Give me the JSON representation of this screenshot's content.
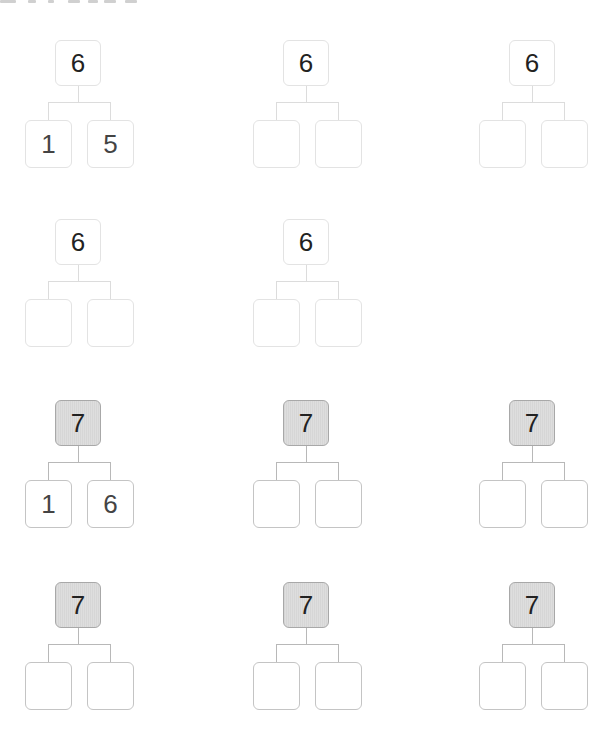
{
  "worksheet": {
    "rows": [
      {
        "style": "plain",
        "trees": [
          {
            "top": "6",
            "left": "1",
            "right": "5"
          },
          {
            "top": "6",
            "left": "",
            "right": ""
          },
          {
            "top": "6",
            "left": "",
            "right": ""
          }
        ]
      },
      {
        "style": "plain",
        "trees": [
          {
            "top": "6",
            "left": "",
            "right": ""
          },
          {
            "top": "6",
            "left": "",
            "right": ""
          }
        ]
      },
      {
        "style": "shaded",
        "trees": [
          {
            "top": "7",
            "left": "1",
            "right": "6"
          },
          {
            "top": "7",
            "left": "",
            "right": ""
          },
          {
            "top": "7",
            "left": "",
            "right": ""
          }
        ]
      },
      {
        "style": "shaded",
        "trees": [
          {
            "top": "7",
            "left": "",
            "right": ""
          },
          {
            "top": "7",
            "left": "",
            "right": ""
          },
          {
            "top": "7",
            "left": "",
            "right": ""
          }
        ]
      }
    ]
  },
  "colors": {
    "box_border_light": "#e3e3e3",
    "box_border_dark": "#a8a8a8",
    "shaded_fill": "#d9d9d9",
    "text": "#222222"
  }
}
